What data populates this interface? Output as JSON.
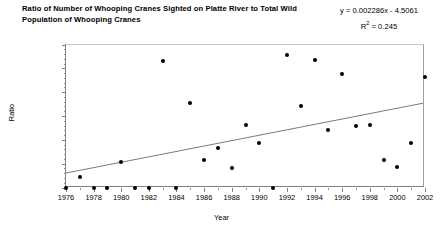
{
  "chart_data": {
    "type": "scatter",
    "title": "Ratio of Number of Whooping Cranes Sighted on Platte River to Total Wild Population of Whooping Cranes",
    "xlabel": "Year",
    "ylabel": "Ratio",
    "xlim": [
      1976,
      2002
    ],
    "ylim": [
      0.0,
      0.12
    ],
    "grid": false,
    "legend": null,
    "xticks": [
      "1976",
      "1978",
      "1980",
      "1982",
      "1984",
      "1986",
      "1988",
      "1990",
      "1992",
      "1994",
      "1996",
      "1998",
      "2000",
      "2002"
    ],
    "xtick_values": [
      1976,
      1978,
      1980,
      1982,
      1984,
      1986,
      1988,
      1990,
      1992,
      1994,
      1996,
      1998,
      2000,
      2002
    ],
    "xtick_minor_step": 1,
    "yticks": [
      "0.0000",
      "0.0200",
      "0.0400",
      "0.0600",
      "0.0800",
      "0.1000",
      "0.1200"
    ],
    "ytick_values": [
      0.0,
      0.02,
      0.04,
      0.06,
      0.08,
      0.1,
      0.12
    ],
    "ytick_minor_step": 0.004,
    "marker": "filled-circle",
    "marker_color": "#000000",
    "trendline": {
      "equation": "y = 0.002286x - 4.5061",
      "r2_label": "R",
      "r2_exponent": "2",
      "r2_value": " = 0.245",
      "slope": 0.002286,
      "intercept": -4.5061,
      "r_squared": 0.245,
      "color": "#555555"
    },
    "x": [
      1976,
      1977,
      1978,
      1979,
      1980,
      1981,
      1982,
      1983,
      1984,
      1985,
      1986,
      1987,
      1988,
      1989,
      1990,
      1991,
      1992,
      1993,
      1994,
      1995,
      1996,
      1997,
      1998,
      1999,
      2000,
      2001,
      2002
    ],
    "y": [
      0.0,
      0.0085,
      0.0,
      0.0,
      0.0213,
      0.0,
      0.0,
      0.1065,
      0.0,
      0.071,
      0.023,
      0.0335,
      0.0165,
      0.0525,
      0.0375,
      0.0,
      0.1115,
      0.0685,
      0.107,
      0.048,
      0.095,
      0.052,
      0.0525,
      0.023,
      0.017,
      0.037,
      0.093
    ],
    "points": [
      {
        "x": 1976,
        "y": 0.0
      },
      {
        "x": 1977,
        "y": 0.0085
      },
      {
        "x": 1978,
        "y": 0.0
      },
      {
        "x": 1979,
        "y": 0.0
      },
      {
        "x": 1980,
        "y": 0.0213
      },
      {
        "x": 1981,
        "y": 0.0
      },
      {
        "x": 1982,
        "y": 0.0
      },
      {
        "x": 1983,
        "y": 0.1065
      },
      {
        "x": 1984,
        "y": 0.0
      },
      {
        "x": 1985,
        "y": 0.071
      },
      {
        "x": 1986,
        "y": 0.023
      },
      {
        "x": 1987,
        "y": 0.0335
      },
      {
        "x": 1988,
        "y": 0.0165
      },
      {
        "x": 1989,
        "y": 0.0525
      },
      {
        "x": 1990,
        "y": 0.0375
      },
      {
        "x": 1991,
        "y": 0.0
      },
      {
        "x": 1992,
        "y": 0.1115
      },
      {
        "x": 1993,
        "y": 0.0685
      },
      {
        "x": 1994,
        "y": 0.107
      },
      {
        "x": 1995,
        "y": 0.048
      },
      {
        "x": 1996,
        "y": 0.095
      },
      {
        "x": 1997,
        "y": 0.052
      },
      {
        "x": 1998,
        "y": 0.0525
      },
      {
        "x": 1999,
        "y": 0.023
      },
      {
        "x": 2000,
        "y": 0.017
      },
      {
        "x": 2001,
        "y": 0.037
      },
      {
        "x": 2002,
        "y": 0.093
      }
    ]
  }
}
